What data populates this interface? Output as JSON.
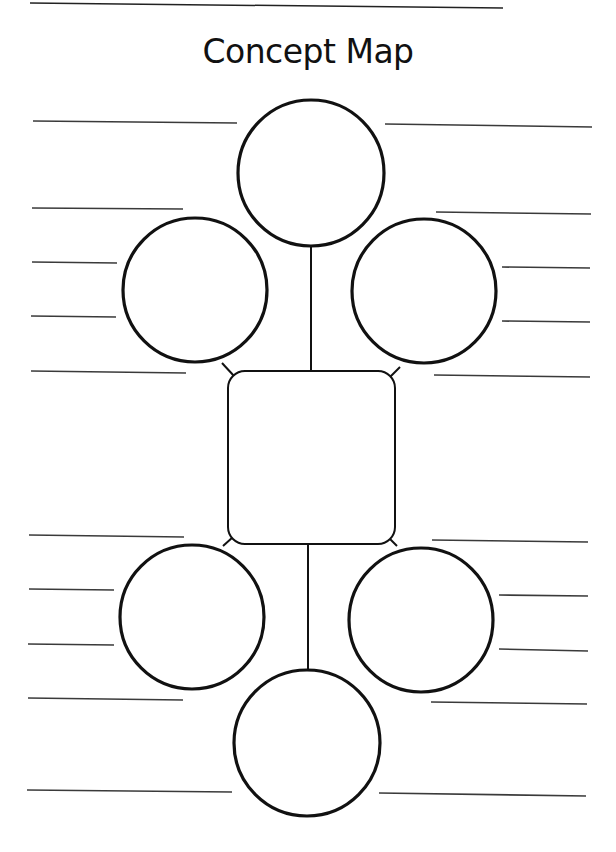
{
  "worksheet": {
    "title": "Concept Map",
    "ink_color": "#111111",
    "line_color": "#3a3a3a",
    "background": "#ffffff"
  },
  "nodes": {
    "top_circle": {
      "label": ""
    },
    "upper_left_circle": {
      "label": ""
    },
    "upper_right_circle": {
      "label": ""
    },
    "center_box": {
      "label": ""
    },
    "lower_left_circle": {
      "label": ""
    },
    "lower_right_circle": {
      "label": ""
    },
    "bottom_circle": {
      "label": ""
    }
  },
  "writing_lines": {
    "count": 20,
    "left_side": 10,
    "right_side": 10
  }
}
